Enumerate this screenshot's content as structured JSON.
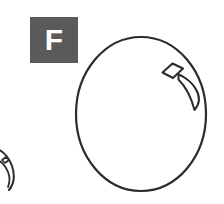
{
  "figure": {
    "panel_label": "F",
    "background_color": "#ffffff",
    "label_box_color": "#5a5a5a",
    "label_text_color": "#fdfdfd",
    "stroke_color": "#2b2b2b",
    "width": 224,
    "height": 204
  },
  "shapes": {
    "main_outline": {
      "name": "large-oval-outline",
      "center_x": 141,
      "center_y": 114,
      "radius_x": 65,
      "radius_y": 77,
      "stroke_width": 2.2,
      "fill": "none"
    },
    "diamond_mark": {
      "name": "diamond-mark",
      "points": "163,72 172,64 182,69 173,78",
      "stroke_width": 2.0,
      "fill": "none"
    },
    "claw_mark": {
      "name": "claw-crescent-mark",
      "stroke_width": 2.0,
      "fill": "none",
      "description": "tapered crescent / fang curving down-left from upper right"
    },
    "cropped_shape": {
      "name": "cropped-neighbor-shape",
      "stroke_width": 2.0,
      "fill": "none",
      "description": "partially visible outline at lower-left image edge"
    }
  }
}
